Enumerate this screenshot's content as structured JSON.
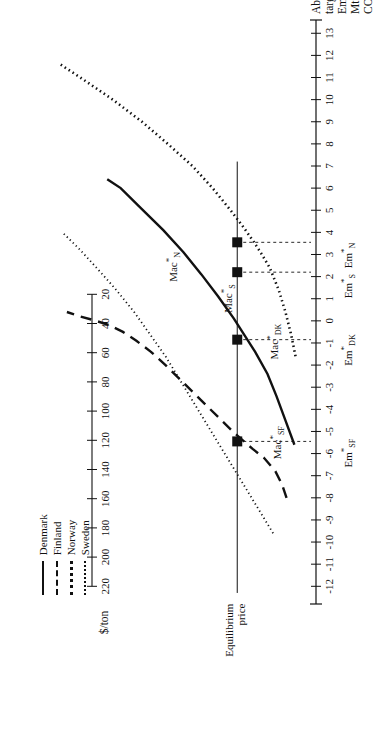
{
  "figure": {
    "rotation_note": "page-rotated-90",
    "x_axis": {
      "title_lines": [
        "Above-target",
        "Emissions",
        "Mton CO"
      ],
      "title_subscript": "2",
      "ticks": [
        -12,
        -11,
        -10,
        -9,
        -8,
        -7,
        -6,
        -5,
        -4,
        -3,
        -2,
        -1,
        0,
        1,
        2,
        3,
        4,
        5,
        6,
        7,
        8,
        9,
        10,
        11,
        12,
        13
      ],
      "tick_labels": [
        "-12",
        "-11",
        "-10",
        "-9",
        "-8",
        "-7",
        "-6",
        "-5",
        "-4",
        "-3",
        "-2",
        "-1",
        "0",
        "1",
        "2",
        "3",
        "4",
        "5",
        "6",
        "7",
        "8",
        "9",
        "10",
        "11",
        "12",
        "13"
      ],
      "range": [
        -12.8,
        13.6
      ]
    },
    "y_axis": {
      "title": "$/ton",
      "ticks": [
        20,
        40,
        60,
        80,
        100,
        120,
        140,
        160,
        180,
        200,
        220
      ],
      "tick_labels": [
        "20",
        "40",
        "60",
        "80",
        "100",
        "120",
        "140",
        "160",
        "180",
        "200",
        "220"
      ],
      "range": [
        0,
        232
      ]
    },
    "equilibrium": {
      "label_lines": [
        "Equilibrium",
        "price"
      ],
      "price": 56.0
    },
    "curve_labels": [
      {
        "id": "mac-n",
        "base": "Mac",
        "star": "*",
        "sub": "N"
      },
      {
        "id": "mac-s",
        "base": "Mac",
        "star": "*",
        "sub": "S"
      },
      {
        "id": "mac-dk",
        "base": "Mac",
        "star": "*",
        "sub": "DK"
      },
      {
        "id": "mac-sf",
        "base": "Mac",
        "star": "*",
        "sub": "SF"
      }
    ],
    "emission_labels": [
      {
        "id": "em-n",
        "base": "Em",
        "star": "*",
        "sub": "N",
        "x": 3.55
      },
      {
        "id": "em-s",
        "base": "Em",
        "star": "*",
        "sub": "S",
        "x": 2.2
      },
      {
        "id": "em-dk",
        "base": "Em",
        "star": "*",
        "sub": "DK",
        "x": -0.85
      },
      {
        "id": "em-sf",
        "base": "Em",
        "star": "*",
        "sub": "SF",
        "x": -5.45
      }
    ],
    "legend": {
      "items": [
        {
          "label": "Denmark",
          "style": "solid",
          "color": "#111111"
        },
        {
          "label": "Finland",
          "style": "dashed",
          "color": "#111111"
        },
        {
          "label": "Norway",
          "style": "dotted-bold",
          "color": "#111111"
        },
        {
          "label": "Sweden",
          "style": "dotted-fine",
          "color": "#111111"
        }
      ]
    }
  },
  "chart_data": {
    "type": "line",
    "title": "",
    "xlabel": "Above-target Emissions Mton CO2",
    "ylabel": "$/ton",
    "xlim": [
      -12.8,
      13.6
    ],
    "ylim": [
      0,
      232
    ],
    "grid": false,
    "legend_position": "bottom-left",
    "annotations": [
      {
        "text": "Equilibrium price",
        "type": "horizontal-reference-line",
        "value": 56
      },
      {
        "text": "Mac*N",
        "points_to": "Norway MAC curve"
      },
      {
        "text": "Mac*S",
        "points_to": "Sweden MAC curve"
      },
      {
        "text": "Mac*DK",
        "points_to": "Denmark MAC curve"
      },
      {
        "text": "Mac*SF",
        "points_to": "Finland MAC curve"
      }
    ],
    "equilibrium_price": 56,
    "equilibrium_points": [
      {
        "country": "Norway",
        "label": "Em*N",
        "x": 3.55,
        "y": 56
      },
      {
        "country": "Sweden",
        "label": "Em*S",
        "x": 2.2,
        "y": 56
      },
      {
        "country": "Denmark",
        "label": "Em*DK",
        "x": -0.85,
        "y": 56
      },
      {
        "country": "Finland",
        "label": "Em*SF",
        "x": -5.45,
        "y": 56
      }
    ],
    "series": [
      {
        "name": "Denmark",
        "style": "solid",
        "x": [
          -5.6,
          -4.5,
          -3.4,
          -2.4,
          -1.4,
          -0.85,
          0.1,
          1.1,
          2.1,
          3.1,
          4.1,
          5.1,
          6.0,
          6.4
        ],
        "y": [
          5,
          13,
          21,
          29,
          40,
          47,
          59,
          73,
          88,
          104,
          122,
          142,
          160,
          172
        ]
      },
      {
        "name": "Finland",
        "style": "dashed",
        "x": [
          -8.0,
          -7.4,
          -6.8,
          -6.2,
          -5.8,
          -5.45,
          -5.0,
          -4.4,
          -3.8,
          -3.2,
          -2.6,
          -2.0,
          -1.4,
          -0.9,
          -0.5,
          -0.2,
          0.0,
          0.2,
          0.4
        ],
        "y": [
          12,
          16,
          22,
          32,
          42,
          50,
          60,
          72,
          84,
          96,
          108,
          120,
          133,
          146,
          158,
          170,
          182,
          196,
          208
        ]
      },
      {
        "name": "Norway",
        "style": "dotted-bold",
        "x": [
          -1.6,
          -0.6,
          0.4,
          1.4,
          2.4,
          3.0,
          3.55,
          4.2,
          5.0,
          6.0,
          7.0,
          8.0,
          9.0,
          10.0,
          11.0,
          11.6
        ],
        "y": [
          4,
          8,
          13,
          19,
          27,
          34,
          41,
          50,
          62,
          78,
          96,
          118,
          141,
          167,
          196,
          214
        ]
      },
      {
        "name": "Sweden",
        "style": "dotted-fine",
        "x": [
          -9.6,
          -8.6,
          -7.6,
          -6.6,
          -5.6,
          -4.6,
          -3.6,
          -2.6,
          -1.6,
          -0.6,
          0.4,
          1.4,
          2.2,
          3.2,
          4.0
        ],
        "y": [
          24,
          36,
          48,
          60,
          72,
          84,
          96,
          108,
          120,
          134,
          148,
          164,
          178,
          196,
          212
        ]
      }
    ]
  }
}
